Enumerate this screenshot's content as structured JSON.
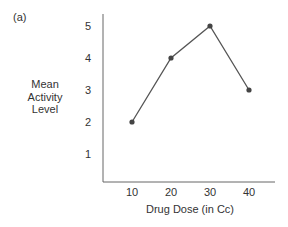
{
  "panel_label": "(a)",
  "chart_data": {
    "type": "line",
    "title": "",
    "xlabel": "Drug Dose (in Cc)",
    "ylabel": [
      "Mean",
      "Activity",
      "Level"
    ],
    "x": [
      10,
      20,
      30,
      40
    ],
    "categories": [
      "10",
      "20",
      "30",
      "40"
    ],
    "series": [
      {
        "name": "Mean Activity Level",
        "values": [
          2,
          4,
          5,
          3
        ]
      }
    ],
    "xticks": [
      "10",
      "20",
      "30",
      "40"
    ],
    "yticks": [
      "1",
      "2",
      "3",
      "4",
      "5"
    ],
    "ylim": [
      0,
      5.3
    ],
    "xlim": [
      2,
      48
    ],
    "grid": false,
    "legend": "none",
    "markers": true
  },
  "colors": {
    "line": "#555555",
    "marker": "#444444",
    "axis": "#666666",
    "text": "#333333"
  }
}
